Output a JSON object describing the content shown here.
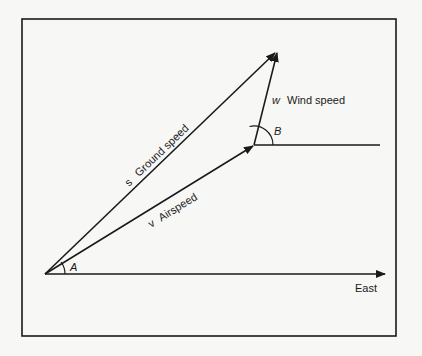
{
  "diagram": {
    "colors": {
      "background": "#f7f7f5",
      "ink": "#1a1a1a"
    },
    "vectors": {
      "ground_speed": {
        "symbol": "s",
        "label": "Ground speed"
      },
      "airspeed": {
        "symbol": "v",
        "label": "Airspeed"
      },
      "wind_speed": {
        "symbol": "w",
        "label": "Wind speed"
      }
    },
    "angles": {
      "a": "A",
      "b": "B"
    },
    "axis": {
      "east": "East"
    }
  }
}
